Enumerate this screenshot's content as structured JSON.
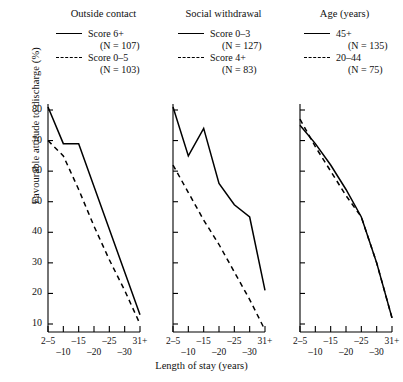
{
  "chart_data": {
    "type": "line",
    "title": "",
    "xlabel": "Length of stay (years)",
    "ylabel": "Favourable attitude to discharge (%)",
    "categories": [
      "2–5",
      "6–10",
      "11–15",
      "16–20",
      "21–25",
      "26–30",
      "31+"
    ],
    "tick_labels_upper": [
      "2–5",
      "–15",
      "–25",
      "31+"
    ],
    "tick_labels_lower": [
      "–10",
      "–20",
      "–30"
    ],
    "tick_label_rows": [
      {
        "text": "2–5",
        "index": 0,
        "row": "upper"
      },
      {
        "text": "–10",
        "index": 1,
        "row": "lower"
      },
      {
        "text": "–15",
        "index": 2,
        "row": "upper"
      },
      {
        "text": "–20",
        "index": 3,
        "row": "lower"
      },
      {
        "text": "–25",
        "index": 4,
        "row": "upper"
      },
      {
        "text": "–30",
        "index": 5,
        "row": "lower"
      },
      {
        "text": "31+",
        "index": 6,
        "row": "upper"
      }
    ],
    "ylim": [
      5,
      84
    ],
    "yticks": [
      10,
      20,
      30,
      40,
      50,
      60,
      70,
      80
    ],
    "ytick_labels": [
      "10",
      "20",
      "30",
      "40",
      "50",
      "60",
      "70",
      "80"
    ],
    "grid": false,
    "legend_position": "above-panel",
    "line_color": "#000000",
    "panels": [
      {
        "title": "Outside contact",
        "series": [
          {
            "name": "Score 6+",
            "n_label": "(N = 107)",
            "style": "solid",
            "values": [
              81,
              69,
              69,
              55,
              41,
              27,
              13
            ]
          },
          {
            "name": "Score 0–5",
            "n_label": "(N = 103)",
            "style": "dashed",
            "values": [
              70,
              65,
              54,
              42,
              31,
              21,
              10
            ]
          }
        ]
      },
      {
        "title": "Social withdrawal",
        "series": [
          {
            "name": "Score 0–3",
            "n_label": "(N = 127)",
            "style": "solid",
            "values": [
              81,
              65,
              74,
              56,
              49,
              45,
              21
            ]
          },
          {
            "name": "Score 4+",
            "n_label": "(N = 83)",
            "style": "dashed",
            "values": [
              62,
              53,
              44,
              36,
              27,
              18,
              8
            ]
          }
        ]
      },
      {
        "title": "Age (years)",
        "series": [
          {
            "name": "45+",
            "n_label": "(N = 135)",
            "style": "solid",
            "values": [
              75,
              69,
              62,
              54,
              45,
              30,
              12
            ]
          },
          {
            "name": "20–44",
            "n_label": "(N = 75)",
            "style": "dashed",
            "values": [
              77,
              68,
              60,
              52,
              45,
              30,
              12
            ]
          }
        ]
      }
    ]
  }
}
